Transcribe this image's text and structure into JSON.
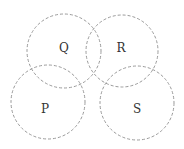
{
  "diagram": {
    "type": "overlapping-circles",
    "stroke_color": "#9a9a9a",
    "stroke_style": "dashed",
    "circles": [
      {
        "label": "Q",
        "cx": 64,
        "cy": 51,
        "r": 37,
        "label_x": 64,
        "label_y": 52
      },
      {
        "label": "R",
        "cx": 122,
        "cy": 51,
        "r": 36,
        "label_x": 121,
        "label_y": 52
      },
      {
        "label": "P",
        "cx": 48,
        "cy": 102,
        "r": 37,
        "label_x": 45,
        "label_y": 113
      },
      {
        "label": "S",
        "cx": 137,
        "cy": 103,
        "r": 37,
        "label_x": 137,
        "label_y": 113
      }
    ]
  }
}
